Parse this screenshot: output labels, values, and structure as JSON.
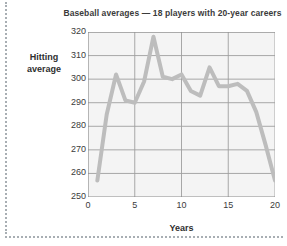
{
  "chart_data": {
    "type": "line",
    "title": "Baseball averages — 18 players with 20-year careers",
    "xlabel": "Years",
    "ylabel": "Hitting average",
    "ylabel_line1": "Hitting",
    "ylabel_line2": "average",
    "xlim": [
      0,
      20
    ],
    "ylim": [
      250,
      320
    ],
    "grid": true,
    "legend": "none",
    "xticks": [
      0,
      5,
      10,
      15,
      20
    ],
    "yticks": [
      250,
      260,
      270,
      280,
      290,
      300,
      310,
      320
    ],
    "series": [
      {
        "name": "Hitting average",
        "color": "#bdbdbd",
        "x": [
          1,
          2,
          3,
          4,
          5,
          6,
          7,
          8,
          9,
          10,
          11,
          12,
          13,
          14,
          15,
          16,
          17,
          18,
          19,
          20
        ],
        "values": [
          257,
          285,
          302,
          291,
          290,
          299,
          318,
          301,
          300,
          302,
          295,
          293,
          305,
          297,
          297,
          298,
          295,
          286,
          272,
          257
        ]
      }
    ]
  },
  "axes": {
    "ytick_labels": [
      "320",
      "310",
      "300",
      "290",
      "280",
      "270",
      "260",
      "250"
    ],
    "xtick_labels": [
      "0",
      "5",
      "10",
      "15",
      "20"
    ]
  },
  "style": {
    "line_color": "#bdbdbd",
    "grid_color": "#9e9e9e",
    "panel_color": "#f4f4f4",
    "text_color": "#3b3b3b",
    "border_color": "#9aa0a6"
  }
}
